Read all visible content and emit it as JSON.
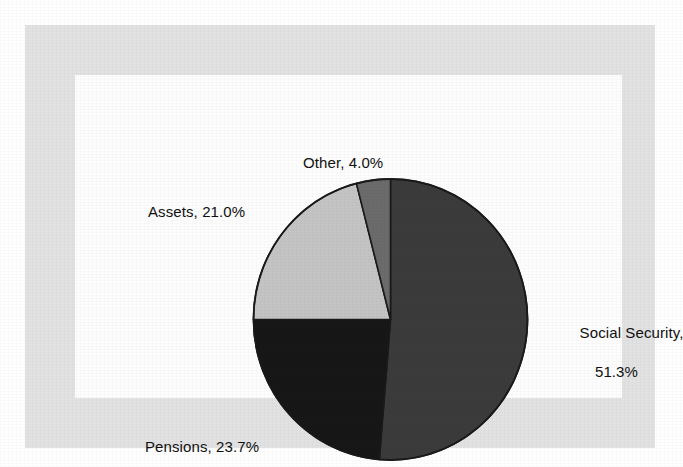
{
  "figure": {
    "background_color": "#ffffff",
    "frame_color": "#e2e2e2",
    "panel_color": "#fdfdfd",
    "outline_color": "#1a1a1a"
  },
  "labels": {
    "other": "Other, 4.0%",
    "assets": "Assets, 21.0%",
    "pensions": "Pensions, 23.7%",
    "social_security_line1": "Social Security,",
    "social_security_line2": "51.3%"
  },
  "chart_data": {
    "type": "pie",
    "title": "",
    "subtitle": "",
    "xlabel": "",
    "ylabel": "",
    "grid": false,
    "legend_position": "none",
    "label_format": "{name}, {value}%",
    "start_angle_deg": 0,
    "direction": "clockwise",
    "categories": [
      "Social Security",
      "Pensions",
      "Assets",
      "Other"
    ],
    "values": [
      51.3,
      23.7,
      21.0,
      4.0
    ],
    "units": "percent",
    "total": 100.0,
    "slices": [
      {
        "name": "Social Security",
        "value": 51.3,
        "label": "Social Security, 51.3%",
        "color": "#3b3b3b",
        "sweep_deg": 184.68,
        "start_deg": 0.0,
        "end_deg": 184.68,
        "label_side": "right"
      },
      {
        "name": "Pensions",
        "value": 23.7,
        "label": "Pensions, 23.7%",
        "color": "#171717",
        "sweep_deg": 85.32,
        "start_deg": 184.68,
        "end_deg": 270.0,
        "label_side": "bottom-left"
      },
      {
        "name": "Assets",
        "value": 21.0,
        "label": "Assets, 21.0%",
        "color": "#c4c4c4",
        "sweep_deg": 75.6,
        "start_deg": 270.0,
        "end_deg": 345.6,
        "label_side": "left"
      },
      {
        "name": "Other",
        "value": 4.0,
        "label": "Other, 4.0%",
        "color": "#6b6b6b",
        "sweep_deg": 14.4,
        "start_deg": 345.6,
        "end_deg": 360.0,
        "label_side": "top"
      }
    ]
  }
}
